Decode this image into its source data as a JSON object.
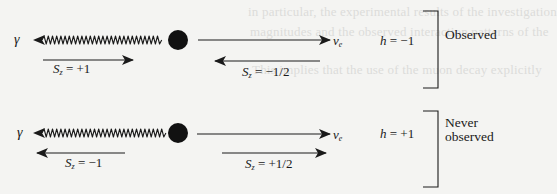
{
  "background_bleed": [
    {
      "text": "in particular, the experimental results of the investigation"
    },
    {
      "text": "magnitudes and the observed interaction patterns of the"
    },
    {
      "text": "This implies that the use of the muon decay explicitly"
    }
  ],
  "rows": [
    {
      "id": "observed",
      "photon_label": "γ",
      "neutrino_label_main": "ν",
      "neutrino_label_sub": "e",
      "photon_spin": {
        "symbol": "S",
        "sub": "z",
        "value": "= +1",
        "direction": "right"
      },
      "neutrino_spin": {
        "symbol": "S",
        "sub": "z",
        "value": "= −1/2",
        "direction": "left"
      },
      "helicity": {
        "symbol": "h",
        "value": "= −1"
      },
      "status_lines": [
        "Observed"
      ]
    },
    {
      "id": "never-observed",
      "photon_label": "γ",
      "neutrino_label_main": "ν",
      "neutrino_label_sub": "e",
      "photon_spin": {
        "symbol": "S",
        "sub": "z",
        "value": "= −1",
        "direction": "left"
      },
      "neutrino_spin": {
        "symbol": "S",
        "sub": "z",
        "value": "= +1/2",
        "direction": "right"
      },
      "helicity": {
        "symbol": "h",
        "value": "= +1"
      },
      "status_lines": [
        "Never",
        "observed"
      ]
    }
  ],
  "colors": {
    "ink": "#1a1a1a",
    "background": "#f4f4f2",
    "bleed": "#dcdcda"
  }
}
